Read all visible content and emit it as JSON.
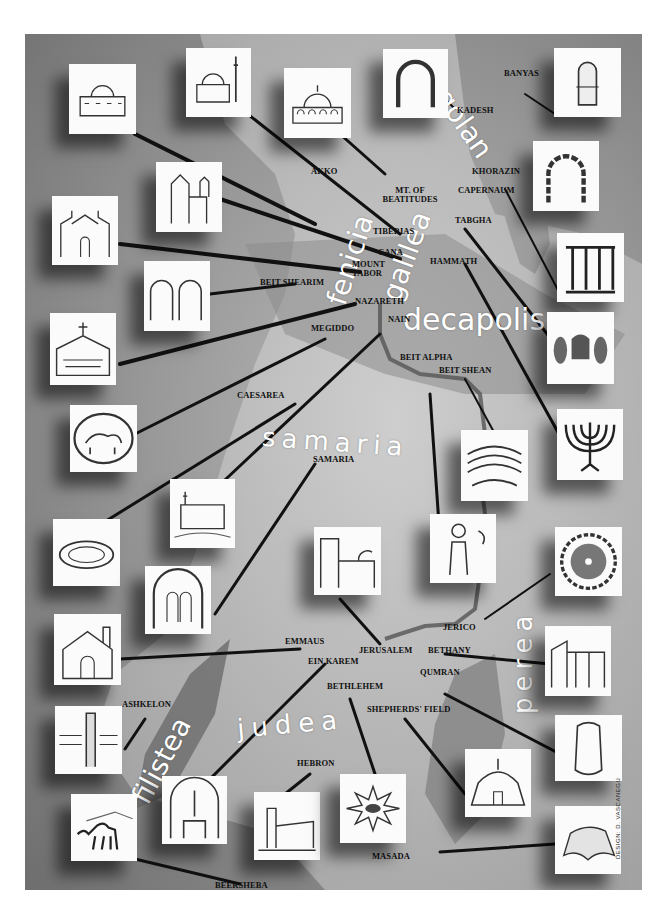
{
  "map": {
    "title": "Map of the Holy Land with landmark illustrations",
    "regions": [
      {
        "id": "golan",
        "label": "golan"
      },
      {
        "id": "galilea",
        "label": "galilea"
      },
      {
        "id": "fenicia",
        "label": "fenicia"
      },
      {
        "id": "decapolis",
        "label": "decapolis"
      },
      {
        "id": "samaria",
        "label": "samaria"
      },
      {
        "id": "perea",
        "label": "perea"
      },
      {
        "id": "judea",
        "label": "judea"
      },
      {
        "id": "filistea",
        "label": "filistea"
      }
    ],
    "places": [
      {
        "id": "banyas",
        "label": "BANYAS"
      },
      {
        "id": "kadesh",
        "label": "KADESH"
      },
      {
        "id": "akko",
        "label": "AKKO"
      },
      {
        "id": "mt-beatitudes",
        "label": "MT. OF BEATITUDES"
      },
      {
        "id": "khorazin",
        "label": "KHORAZIN"
      },
      {
        "id": "capernaum",
        "label": "CAPERNAUM"
      },
      {
        "id": "tabgha",
        "label": "TABGHA"
      },
      {
        "id": "tiberias",
        "label": "TIBERIAS"
      },
      {
        "id": "cana",
        "label": "CANA"
      },
      {
        "id": "mount-tabor",
        "label": "MOUNT TABOR"
      },
      {
        "id": "hammath",
        "label": "HAMMATH"
      },
      {
        "id": "beit-shearim",
        "label": "BEIT SHEARIM"
      },
      {
        "id": "nazareth",
        "label": "NAZARETH"
      },
      {
        "id": "nain",
        "label": "NAIN"
      },
      {
        "id": "megiddo",
        "label": "MEGIDDO"
      },
      {
        "id": "beit-alpha",
        "label": "BEIT ALPHA"
      },
      {
        "id": "beit-shean",
        "label": "BEIT SHEAN"
      },
      {
        "id": "caesarea",
        "label": "CAESAREA"
      },
      {
        "id": "samaria-town",
        "label": "SAMARIA"
      },
      {
        "id": "jerico",
        "label": "JERICO"
      },
      {
        "id": "emmaus",
        "label": "EMMAUS"
      },
      {
        "id": "jerusalem",
        "label": "JERUSALEM"
      },
      {
        "id": "bethany",
        "label": "BETHANY"
      },
      {
        "id": "ein-karem",
        "label": "EIN KAREM"
      },
      {
        "id": "qumran",
        "label": "QUMRAN"
      },
      {
        "id": "bethlehem",
        "label": "BETHLEHEM"
      },
      {
        "id": "shepherds-field",
        "label": "SHEPHERDS' FIELD"
      },
      {
        "id": "ashkelon",
        "label": "ASHKELON"
      },
      {
        "id": "hebron",
        "label": "HEBRON"
      },
      {
        "id": "masada",
        "label": "MASADA"
      },
      {
        "id": "beersheba",
        "label": "BEERSHEBA"
      }
    ],
    "tiles": [
      {
        "id": "akko-mosque",
        "icon": "domed-building-icon"
      },
      {
        "id": "minaret-mosque",
        "icon": "mosque-minaret-icon"
      },
      {
        "id": "beatitudes-church",
        "icon": "octagonal-church-icon"
      },
      {
        "id": "kadesh-arch",
        "icon": "stone-arch-icon"
      },
      {
        "id": "banyas-niche",
        "icon": "rock-niche-icon"
      },
      {
        "id": "tiberias-church",
        "icon": "twin-tower-church-icon"
      },
      {
        "id": "khorazin-arch",
        "icon": "ruined-arch-icon"
      },
      {
        "id": "cana-church",
        "icon": "church-facade-icon"
      },
      {
        "id": "capernaum-synagogue",
        "icon": "synagogue-columns-icon"
      },
      {
        "id": "beit-shearim-caves",
        "icon": "cave-arches-icon"
      },
      {
        "id": "nazareth-basilica",
        "icon": "basilica-icon"
      },
      {
        "id": "tabgha-fishes",
        "icon": "loaves-fishes-icon"
      },
      {
        "id": "megiddo-seal",
        "icon": "lion-seal-icon"
      },
      {
        "id": "hammath-menorah",
        "icon": "menorah-icon"
      },
      {
        "id": "beit-shean-theater",
        "icon": "theater-icon"
      },
      {
        "id": "nain-chapel",
        "icon": "chapel-icon"
      },
      {
        "id": "caesarea-amphitheater",
        "icon": "amphitheater-icon"
      },
      {
        "id": "beit-alpha-mosaic",
        "icon": "mosaic-figure-icon"
      },
      {
        "id": "samaria-arch",
        "icon": "arched-window-icon"
      },
      {
        "id": "jerusalem-sepulchre",
        "icon": "holy-sepulchre-icon"
      },
      {
        "id": "jerico-mosaic",
        "icon": "round-mosaic-icon"
      },
      {
        "id": "emmaus-church",
        "icon": "church-facade-icon"
      },
      {
        "id": "bethany-church",
        "icon": "church-ruins-icon"
      },
      {
        "id": "ashkelon-pillar",
        "icon": "pillar-ruins-icon"
      },
      {
        "id": "qumran-jar",
        "icon": "scroll-jar-icon"
      },
      {
        "id": "ein-karem-well",
        "icon": "well-icon"
      },
      {
        "id": "hebron-town",
        "icon": "town-tower-icon"
      },
      {
        "id": "bethlehem-star",
        "icon": "star-icon"
      },
      {
        "id": "shepherds-chapel",
        "icon": "tent-chapel-icon"
      },
      {
        "id": "masada-rock",
        "icon": "mesa-rock-icon"
      },
      {
        "id": "beersheba-camel",
        "icon": "camel-tent-icon"
      }
    ],
    "signature": "DESIGN: D. VASCANEGU",
    "colors": {
      "background": "#9a9a9a",
      "land_light": "#c4c4c4",
      "sea_dark": "#6d6d6d",
      "river": "#5b5b5b",
      "leader": "#111111",
      "tile": "#fbfbfb"
    }
  }
}
